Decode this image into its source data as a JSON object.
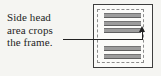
{
  "figure": {
    "caption": {
      "lines": [
        "Side head",
        "area crops",
        "the frame."
      ]
    },
    "frame": {
      "text_line_count": 5
    },
    "colors": {
      "bg": "#f5f5f2",
      "frame_border": "#3e3e3e",
      "dashed_border": "#8d8d8d",
      "text_bar": "#9c9c9c",
      "callout": "#222222",
      "caption_text": "#1e1e1e"
    }
  }
}
